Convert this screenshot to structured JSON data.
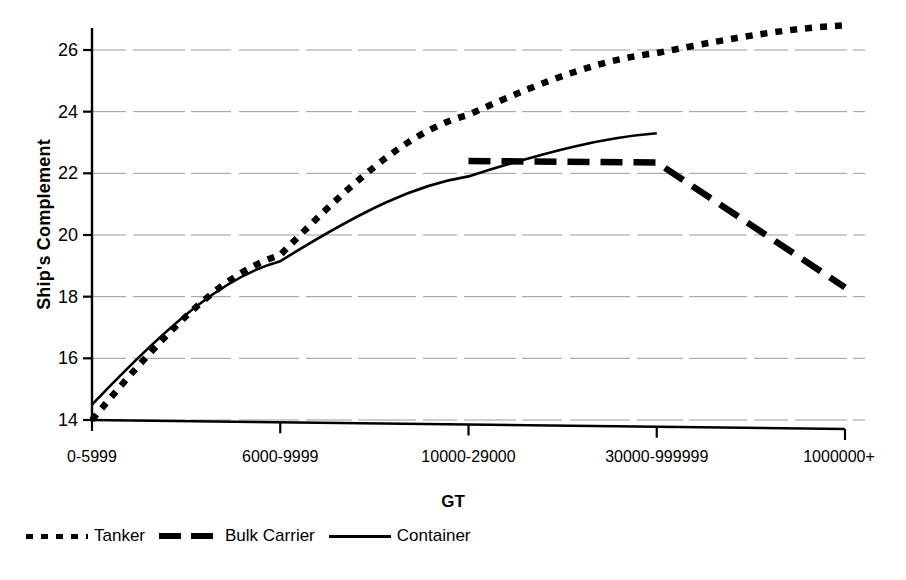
{
  "chart_data": {
    "type": "line",
    "title": "",
    "xlabel": "GT",
    "ylabel": "Ship's Complement",
    "categories": [
      "0-5999",
      "6000-9999",
      "10000-29000",
      "30000-999999",
      "1000000+"
    ],
    "ylim": [
      14,
      27
    ],
    "yticks": [
      14,
      16,
      18,
      20,
      22,
      24,
      26
    ],
    "grid": true,
    "legend_position": "bottom-left",
    "series": [
      {
        "name": "Tanker",
        "style": "dotted",
        "color": "#000000",
        "values": [
          14.0,
          19.35,
          23.9,
          25.9,
          26.8
        ]
      },
      {
        "name": "Bulk Carrier",
        "style": "dashed",
        "color": "#000000",
        "values": [
          null,
          null,
          22.4,
          22.35,
          18.3
        ]
      },
      {
        "name": "Container",
        "style": "solid",
        "color": "#000000",
        "values": [
          14.5,
          19.15,
          21.9,
          23.3,
          null
        ]
      }
    ]
  },
  "axes": {
    "y_title": "Ship's Complement",
    "x_title": "GT",
    "y_tick_labels": [
      "26",
      "24",
      "22",
      "20",
      "18",
      "16",
      "14"
    ],
    "x_tick_labels": [
      "0-5999",
      "6000-9999",
      "10000-29000",
      "30000-999999",
      "1000000+"
    ]
  },
  "legend": {
    "items": [
      {
        "label": "Tanker",
        "marker": "dotted-line-swatch"
      },
      {
        "label": "Bulk Carrier",
        "marker": "dashed-line-swatch"
      },
      {
        "label": "Container",
        "marker": "solid-line-swatch"
      }
    ]
  }
}
